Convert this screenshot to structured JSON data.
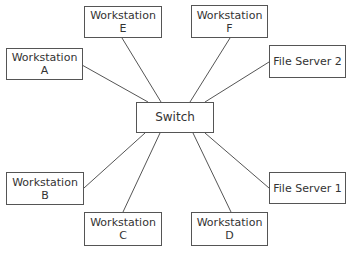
{
  "diagram": {
    "type": "star-network-topology",
    "hub": {
      "id": "switch",
      "label": "Switch",
      "box": [
        136,
        102,
        78,
        31
      ]
    },
    "nodes": [
      {
        "id": "ws-a",
        "line1": "Workstation",
        "line2": "A",
        "box": [
          6,
          48,
          77,
          32
        ],
        "anchor": [
          82,
          65
        ],
        "hub_anchor": [
          148,
          102
        ]
      },
      {
        "id": "ws-e",
        "line1": "Workstation",
        "line2": "E",
        "box": [
          84,
          6,
          78,
          32
        ],
        "anchor": [
          122,
          38
        ],
        "hub_anchor": [
          161,
          102
        ]
      },
      {
        "id": "ws-f",
        "line1": "Workstation",
        "line2": "F",
        "box": [
          191,
          5,
          77,
          33
        ],
        "anchor": [
          230,
          38
        ],
        "hub_anchor": [
          190,
          102
        ]
      },
      {
        "id": "fs-2",
        "line1": "File Server 2",
        "line2": "",
        "box": [
          269,
          45,
          77,
          33
        ],
        "anchor": [
          269,
          62
        ],
        "hub_anchor": [
          205,
          102
        ]
      },
      {
        "id": "ws-b",
        "line1": "Workstation",
        "line2": "B",
        "box": [
          6,
          172,
          78,
          33
        ],
        "anchor": [
          84,
          188
        ],
        "hub_anchor": [
          145,
          133
        ]
      },
      {
        "id": "ws-c",
        "line1": "Workstation",
        "line2": "C",
        "box": [
          84,
          212,
          78,
          34
        ],
        "anchor": [
          123,
          212
        ],
        "hub_anchor": [
          160,
          133
        ]
      },
      {
        "id": "ws-d",
        "line1": "Workstation",
        "line2": "D",
        "box": [
          191,
          212,
          77,
          34
        ],
        "anchor": [
          231,
          212
        ],
        "hub_anchor": [
          193,
          133
        ]
      },
      {
        "id": "fs-1",
        "line1": "File Server 1",
        "line2": "",
        "box": [
          269,
          172,
          77,
          32
        ],
        "anchor": [
          269,
          188
        ],
        "hub_anchor": [
          205,
          133
        ]
      }
    ],
    "colors": {
      "border": "#555555",
      "line": "#555555",
      "text": "#333333",
      "background": "#ffffff"
    }
  }
}
